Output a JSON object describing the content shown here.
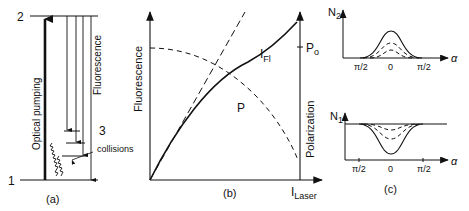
{
  "panel_a": {
    "caption": "(a)",
    "level_top": "2",
    "level_bottom": "1",
    "level_mid": "3",
    "pump_label": "Optical pumping",
    "fluorescence_label": "Fluorescence",
    "collisions_label": "collisions"
  },
  "panel_b": {
    "caption": "(b)",
    "y_left_label": "Fluorescence",
    "y_right_label": "Polarization",
    "x_label_main": "I",
    "x_label_sub": "Laser",
    "curve_fl_main": "I",
    "curve_fl_sub": "Fl",
    "curve_p": "P",
    "p0_main": "P",
    "p0_sub": "o"
  },
  "panel_c": {
    "caption": "(c)",
    "top_y_main": "N",
    "top_y_sub": "2",
    "bottom_y_main": "N",
    "bottom_y_sub": "1",
    "x_label": "α",
    "tick_left": "π/2",
    "tick_center": "0",
    "tick_right": "π/2"
  },
  "colors": {
    "ink": "#111111",
    "background": "#ffffff"
  }
}
